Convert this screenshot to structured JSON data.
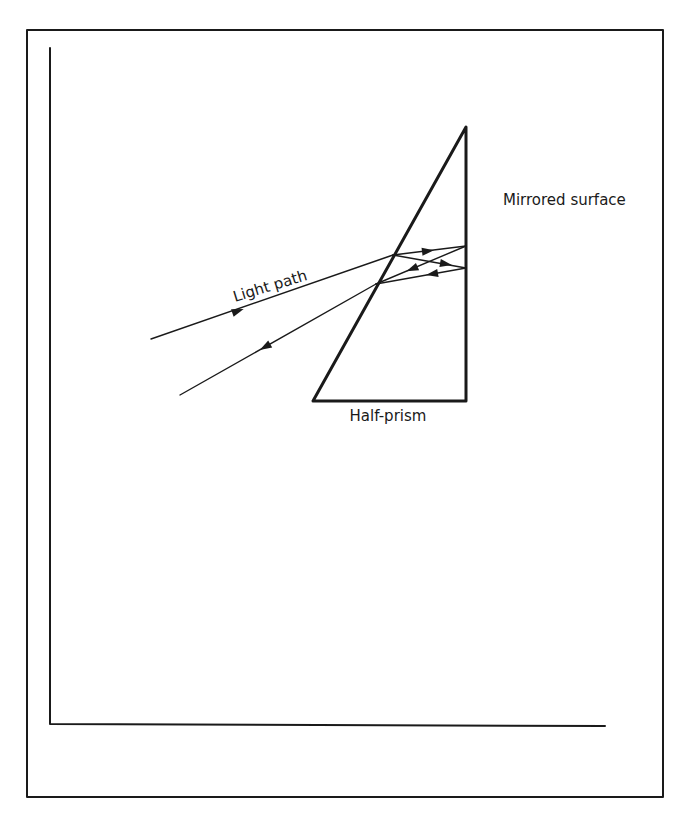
{
  "diagram": {
    "labels": {
      "mirrored_surface": "Mirrored surface",
      "light_path": "Light path",
      "half_prism": "Half-prism"
    },
    "colors": {
      "ink": "#1a1a1a",
      "background": "#ffffff"
    },
    "components": [
      {
        "id": "prism",
        "type": "right-triangle",
        "description": "Half-prism with vertical mirrored back face"
      },
      {
        "id": "mirror",
        "type": "surface",
        "description": "Mirrored surface on vertical face of prism"
      },
      {
        "id": "incident-ray",
        "type": "ray",
        "direction": "toward prism"
      },
      {
        "id": "internal-rays",
        "type": "ray-set",
        "count": 4,
        "description": "Two reflections between hypotenuse and mirrored face"
      },
      {
        "id": "return-ray",
        "type": "ray",
        "direction": "away from prism"
      }
    ]
  }
}
